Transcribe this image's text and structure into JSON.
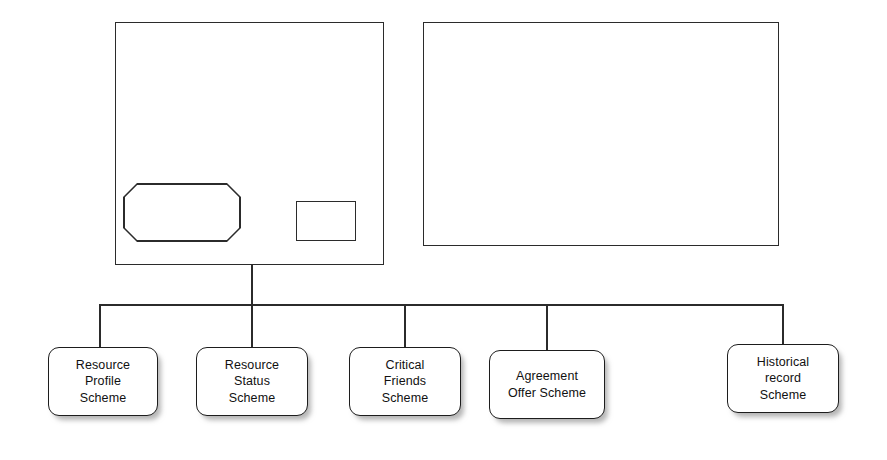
{
  "diagram": {
    "stroke_color": "#2b2b2b",
    "node_border_color": "#1d1d1d",
    "background_color": "#ffffff",
    "shadow_color": "rgba(120,120,120,0.55)",
    "containers": [
      {
        "name": "left-container",
        "label": ""
      },
      {
        "name": "right-container",
        "label": ""
      }
    ],
    "inner_shapes": [
      {
        "name": "octagon-shape",
        "label": ""
      },
      {
        "name": "small-rectangle-shape",
        "label": ""
      }
    ],
    "nodes": [
      {
        "label": "Resource\nProfile\nScheme"
      },
      {
        "label": "Resource\nStatus\nScheme"
      },
      {
        "label": "Critical\nFriends\nScheme"
      },
      {
        "label": "Agreement\nOffer Scheme"
      },
      {
        "label": "Historical\nrecord\nScheme"
      }
    ]
  }
}
